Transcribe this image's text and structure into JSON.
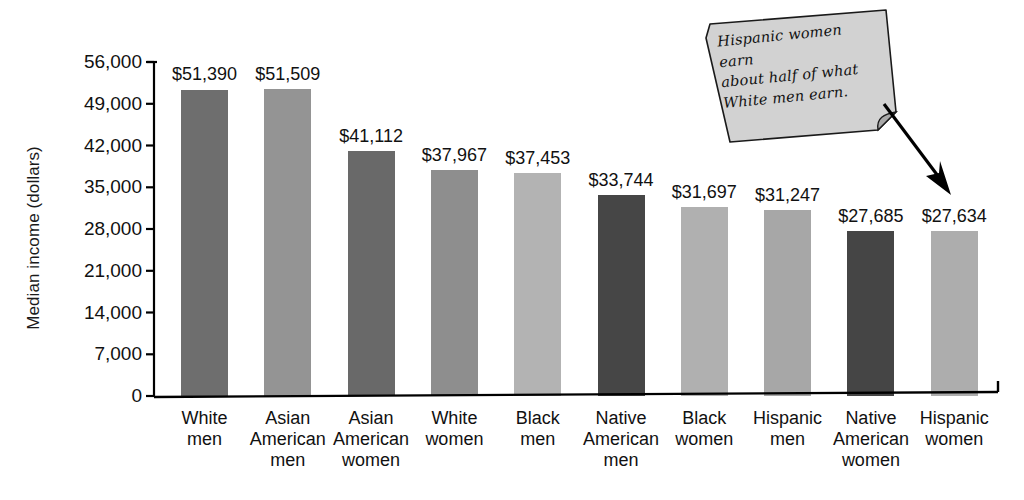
{
  "chart_data": {
    "type": "bar",
    "title": "",
    "xlabel": "",
    "ylabel": "Median income (dollars)",
    "ylim": [
      0,
      56000
    ],
    "grid": false,
    "legend": "none",
    "ytick_labels": [
      "56,000",
      "49,000",
      "42,000",
      "35,000",
      "28,000",
      "21,000",
      "14,000",
      "7,000",
      "0"
    ],
    "ytick_values": [
      56000,
      49000,
      42000,
      35000,
      28000,
      21000,
      14000,
      7000,
      0
    ],
    "categories": [
      "White men",
      "Asian American men",
      "Asian American women",
      "White women",
      "Black men",
      "Native American men",
      "Black women",
      "Hispanic men",
      "Native American women",
      "Hispanic women"
    ],
    "category_lines": [
      [
        "White",
        "men"
      ],
      [
        "Asian",
        "American",
        "men"
      ],
      [
        "Asian",
        "American",
        "women"
      ],
      [
        "White",
        "women"
      ],
      [
        "Black",
        "men"
      ],
      [
        "Native",
        "American",
        "men"
      ],
      [
        "Black",
        "women"
      ],
      [
        "Hispanic",
        "men"
      ],
      [
        "Native",
        "American",
        "women"
      ],
      [
        "Hispanic",
        "women"
      ]
    ],
    "values": [
      51390,
      51509,
      41112,
      37967,
      37453,
      33744,
      31697,
      31247,
      27685,
      27634
    ],
    "value_labels": [
      "$51,390",
      "$51,509",
      "$41,112",
      "$37,967",
      "$37,453",
      "$33,744",
      "$31,697",
      "$31,247",
      "$27,685",
      "$27,634"
    ],
    "bar_colors": [
      "#6e6e6e",
      "#949494",
      "#696969",
      "#8e8e8e",
      "#b3b3b3",
      "#464646",
      "#b0b0b0",
      "#a7a7a7",
      "#454545",
      "#adadad"
    ],
    "annotations": [
      {
        "text": "Hispanic women earn about half of what White men earn.",
        "lines": [
          "Hispanic women earn",
          "about half of what",
          "White men earn."
        ],
        "style": "callout-note",
        "points_to": "Hispanic women"
      }
    ],
    "axis_color": "#000000",
    "background": "#ffffff"
  }
}
